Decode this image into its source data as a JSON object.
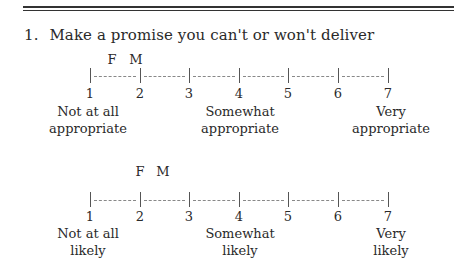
{
  "question": {
    "number": "1.",
    "text": "Make a promise you can't or won't deliver"
  },
  "scales": [
    {
      "name": "appropriateness",
      "points": [
        "1",
        "2",
        "3",
        "4",
        "5",
        "6",
        "7"
      ],
      "markers": [
        {
          "label": "F",
          "position": 1.5
        },
        {
          "label": "M",
          "position": 1.95
        }
      ],
      "anchors": [
        {
          "at": 1,
          "line1": "Not at all",
          "line2": "appropriate"
        },
        {
          "at": 4,
          "line1": "Somewhat",
          "line2": "appropriate"
        },
        {
          "at": 7,
          "line1": "Very",
          "line2": "appropriate"
        }
      ]
    },
    {
      "name": "likelihood",
      "points": [
        "1",
        "2",
        "3",
        "4",
        "5",
        "6",
        "7"
      ],
      "markers": [
        {
          "label": "F",
          "position": 2.0
        },
        {
          "label": "M",
          "position": 2.5
        }
      ],
      "anchors": [
        {
          "at": 1,
          "line1": "Not at all",
          "line2": "likely"
        },
        {
          "at": 4,
          "line1": "Somewhat",
          "line2": "likely"
        },
        {
          "at": 7,
          "line1": "Very",
          "line2": "likely"
        }
      ]
    }
  ]
}
